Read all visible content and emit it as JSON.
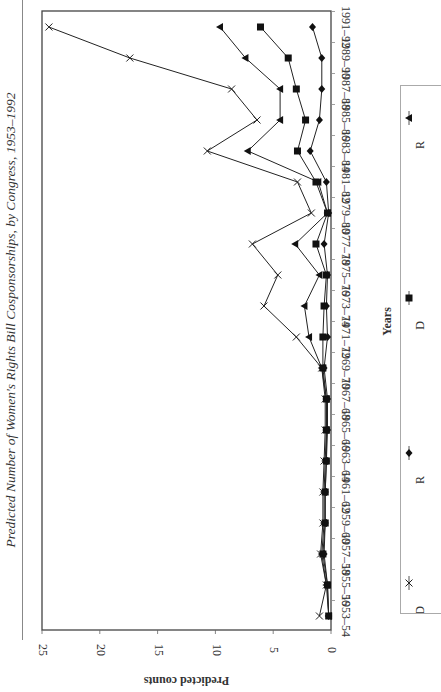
{
  "title": "Predicted Number of Women's Rights Bill Cosponsorships, by Congress, 1953–1992",
  "chart_data": {
    "type": "line",
    "orientation": "rotated 90° clockwise (category axis vertical, value axis horizontal)",
    "title": "Predicted Number of Women's Rights Bill Cosponsorships, by Congress, 1953–1992",
    "xlabel": "Years",
    "ylabel": "Predicted counts",
    "ylim": [
      0,
      25
    ],
    "yticks": [
      0,
      5,
      10,
      15,
      20,
      25
    ],
    "grid": false,
    "legend_position": "below (truncated at image edge)",
    "categories": [
      "1953–54",
      "1955–56",
      "1957–58",
      "1959–60",
      "1961–62",
      "1963–64",
      "1965–66",
      "1967–68",
      "1969–70",
      "1971–72",
      "1973–74",
      "1975–76",
      "1977–78",
      "1979–80",
      "1981–82",
      "1983–84",
      "1985–86",
      "1987–88",
      "1989–90",
      "1991–92"
    ],
    "series": [
      {
        "name": "Series X (cross)",
        "marker": "x",
        "values": [
          1.0,
          0.4,
          0.9,
          0.7,
          0.7,
          0.6,
          0.5,
          0.5,
          0.8,
          3.0,
          5.8,
          4.6,
          6.8,
          1.7,
          2.9,
          10.7,
          6.4,
          8.6,
          17.4,
          24.4
        ]
      },
      {
        "name": "Series Triangle",
        "marker": "triangle",
        "values": [
          0.2,
          0.4,
          0.8,
          0.6,
          0.6,
          0.5,
          0.4,
          0.4,
          0.8,
          1.9,
          2.3,
          1.0,
          3.1,
          0.3,
          1.1,
          7.2,
          4.4,
          4.4,
          7.4,
          9.6
        ]
      },
      {
        "name": "Series Square",
        "marker": "square",
        "values": [
          0.2,
          0.3,
          0.7,
          0.5,
          0.5,
          0.4,
          0.4,
          0.4,
          0.7,
          0.7,
          0.6,
          0.4,
          1.3,
          0.3,
          1.3,
          2.9,
          2.2,
          3.0,
          3.7,
          6.1
        ]
      },
      {
        "name": "Series Diamond",
        "marker": "diamond",
        "values": [
          0.2,
          0.3,
          0.6,
          0.5,
          0.5,
          0.4,
          0.3,
          0.3,
          0.6,
          0.3,
          0.4,
          0.3,
          0.6,
          0.2,
          0.4,
          1.8,
          1.0,
          0.8,
          0.8,
          1.6
        ]
      }
    ]
  },
  "axis": {
    "value_label": "Predicted counts",
    "category_label": "Years"
  },
  "legend": {
    "entries": [
      {
        "marker": "triangle",
        "label": "R"
      },
      {
        "marker": "square",
        "label": "D"
      },
      {
        "marker": "diamond",
        "label": "R"
      },
      {
        "marker": "x",
        "label": "D"
      }
    ]
  }
}
